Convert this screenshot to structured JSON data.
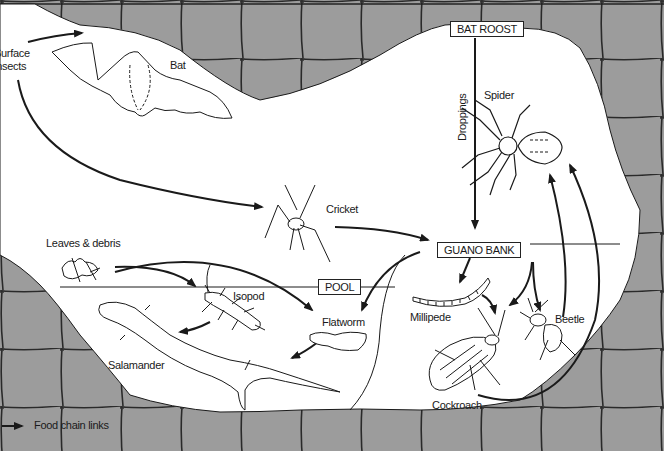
{
  "diagram": {
    "colors": {
      "rock": "#9c9c9c",
      "cave": "#ffffff",
      "line": "#1a1a1a",
      "crack": "#333333"
    },
    "habitats": [
      {
        "id": "bat_roost",
        "label": "BAT ROOST"
      },
      {
        "id": "guano_bank",
        "label": "GUANO BANK"
      },
      {
        "id": "pool",
        "label": "POOL"
      }
    ],
    "organisms": [
      {
        "id": "surface_insects",
        "label": "Surface insects",
        "line1": "Surface",
        "line2": "insects"
      },
      {
        "id": "bat",
        "label": "Bat"
      },
      {
        "id": "spider",
        "label": "Spider"
      },
      {
        "id": "cricket",
        "label": "Cricket"
      },
      {
        "id": "leaves",
        "label": "Leaves & debris"
      },
      {
        "id": "isopod",
        "label": "Isopod"
      },
      {
        "id": "flatworm",
        "label": "Flatworm"
      },
      {
        "id": "salamander",
        "label": "Salamander"
      },
      {
        "id": "millipede",
        "label": "Millipede"
      },
      {
        "id": "beetle",
        "label": "Beetle"
      },
      {
        "id": "cockroach",
        "label": "Cockroach"
      }
    ],
    "edge_labels": {
      "droppings": "Droppings"
    },
    "links": [
      {
        "from": "Surface insects",
        "to": "Bat"
      },
      {
        "from": "Surface insects",
        "to": "Cricket"
      },
      {
        "from": "Bat roost",
        "to": "Guano bank",
        "label": "Droppings"
      },
      {
        "from": "Cricket",
        "to": "Guano bank"
      },
      {
        "from": "Guano bank",
        "to": "Flatworm"
      },
      {
        "from": "Guano bank",
        "to": "Millipede"
      },
      {
        "from": "Guano bank",
        "to": "Cockroach"
      },
      {
        "from": "Guano bank",
        "to": "Beetle"
      },
      {
        "from": "Leaves & debris",
        "to": "Isopod"
      },
      {
        "from": "Leaves & debris",
        "to": "Flatworm"
      },
      {
        "from": "Isopod",
        "to": "Salamander"
      },
      {
        "from": "Flatworm",
        "to": "Salamander"
      },
      {
        "from": "Millipede",
        "to": "Cockroach"
      },
      {
        "from": "Cockroach",
        "to": "Spider"
      },
      {
        "from": "Beetle",
        "to": "Spider"
      }
    ],
    "legend": {
      "label": "Food chain links"
    }
  }
}
